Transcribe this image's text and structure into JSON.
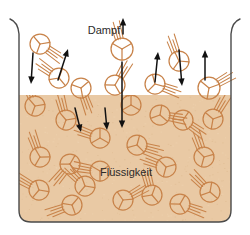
{
  "diagram": {
    "title_vapor": "Dampf",
    "title_liquid": "Flüssigkeit",
    "colors": {
      "vapor_background": "#ffffff",
      "liquid_fill": "#e9caa4",
      "molecule_stroke": "#c8834a",
      "container_stroke": "#4a4a4a",
      "arrow_color": "#111111",
      "label_color": "#2b2b2b"
    },
    "labels": [
      {
        "name": "vapor-label",
        "text": "Dampf",
        "x": 104,
        "y": 34
      },
      {
        "name": "liquid-label",
        "text": "Flüssigkeit",
        "x": 126,
        "y": 176
      }
    ],
    "container": {
      "left_wall_x": 19,
      "right_wall_x": 231,
      "top_y": 20,
      "bottom_y": 222,
      "liquid_surface_y": 95,
      "corner_radius": 12
    },
    "molecules_vapor": [
      {
        "x": 40,
        "y": 44,
        "r": 10,
        "rot": 20,
        "whisk": 35
      },
      {
        "x": 59,
        "y": 78,
        "r": 10,
        "rot": 200,
        "whisk": 215
      },
      {
        "x": 81,
        "y": 88,
        "r": 10,
        "rot": 110,
        "whisk": 70
      },
      {
        "x": 122,
        "y": 49,
        "r": 11,
        "rot": 0,
        "whisk": 255
      },
      {
        "x": 115,
        "y": 85,
        "r": 10,
        "rot": 330,
        "whisk": 300
      },
      {
        "x": 155,
        "y": 84,
        "r": 10,
        "rot": 45,
        "whisk": 20
      },
      {
        "x": 179,
        "y": 61,
        "r": 10,
        "rot": 155,
        "whisk": 250
      },
      {
        "x": 209,
        "y": 88,
        "r": 11,
        "rot": 250,
        "whisk": 330
      }
    ],
    "molecules_liquid": [
      {
        "x": 35,
        "y": 106,
        "r": 10,
        "rot": 20,
        "whisk": 250
      },
      {
        "x": 66,
        "y": 120,
        "r": 10,
        "rot": 140,
        "whisk": 255
      },
      {
        "x": 100,
        "y": 138,
        "r": 10,
        "rot": 300,
        "whisk": 200
      },
      {
        "x": 131,
        "y": 105,
        "r": 10,
        "rot": 60,
        "whisk": 265
      },
      {
        "x": 160,
        "y": 115,
        "r": 10,
        "rot": 190,
        "whisk": 10
      },
      {
        "x": 183,
        "y": 120,
        "r": 10,
        "rot": 95,
        "whisk": 35
      },
      {
        "x": 213,
        "y": 119,
        "r": 10,
        "rot": 250,
        "whisk": 300
      },
      {
        "x": 40,
        "y": 157,
        "r": 10,
        "rot": 30,
        "whisk": 250
      },
      {
        "x": 70,
        "y": 164,
        "r": 10,
        "rot": 210,
        "whisk": 130
      },
      {
        "x": 137,
        "y": 145,
        "r": 10,
        "rot": 75,
        "whisk": 15
      },
      {
        "x": 166,
        "y": 167,
        "r": 10,
        "rot": 135,
        "whisk": 200
      },
      {
        "x": 204,
        "y": 157,
        "r": 10,
        "rot": 15,
        "whisk": 250
      },
      {
        "x": 39,
        "y": 190,
        "r": 10,
        "rot": 160,
        "whisk": 210
      },
      {
        "x": 85,
        "y": 186,
        "r": 10,
        "rot": 280,
        "whisk": 225
      },
      {
        "x": 72,
        "y": 205,
        "r": 10,
        "rot": 100,
        "whisk": 160
      },
      {
        "x": 123,
        "y": 200,
        "r": 10,
        "rot": 25,
        "whisk": 330
      },
      {
        "x": 152,
        "y": 195,
        "r": 10,
        "rot": 200,
        "whisk": 255
      },
      {
        "x": 180,
        "y": 204,
        "r": 10,
        "rot": 330,
        "whisk": 20
      },
      {
        "x": 210,
        "y": 192,
        "r": 10,
        "rot": 70,
        "whisk": 225
      },
      {
        "x": 100,
        "y": 171,
        "r": 10,
        "rot": 240,
        "whisk": 190
      }
    ],
    "arrows": [
      {
        "name": "condensation-arrow-1",
        "x1": 33,
        "y1": 53,
        "x2": 31,
        "y2": 84,
        "dir": "down"
      },
      {
        "name": "evaporation-arrow-1",
        "x1": 58,
        "y1": 80,
        "x2": 68,
        "y2": 49,
        "dir": "up"
      },
      {
        "name": "evaporation-arrow-2",
        "x1": 123,
        "y1": 34,
        "x2": 123,
        "y2": 18,
        "dir": "up"
      },
      {
        "name": "condensation-arrow-2",
        "x1": 122,
        "y1": 62,
        "x2": 122,
        "y2": 128,
        "dir": "down"
      },
      {
        "name": "evaporation-arrow-3",
        "x1": 155,
        "y1": 82,
        "x2": 158,
        "y2": 52,
        "dir": "up"
      },
      {
        "name": "condensation-arrow-3",
        "x1": 179,
        "y1": 50,
        "x2": 182,
        "y2": 86,
        "dir": "down"
      },
      {
        "name": "evaporation-arrow-4",
        "x1": 205,
        "y1": 80,
        "x2": 205,
        "y2": 50,
        "dir": "up"
      },
      {
        "name": "condensation-arrow-4",
        "x1": 75,
        "y1": 108,
        "x2": 81,
        "y2": 132,
        "dir": "down"
      },
      {
        "name": "condensation-arrow-5",
        "x1": 105,
        "y1": 108,
        "x2": 107,
        "y2": 130,
        "dir": "down"
      }
    ]
  }
}
